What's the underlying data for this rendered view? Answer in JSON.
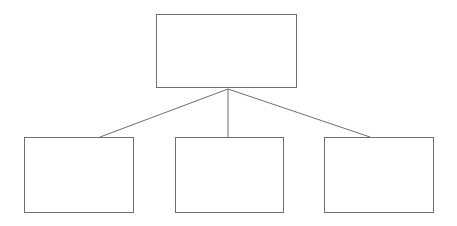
{
  "diagram": {
    "type": "hierarchy-tree",
    "orientation": "top-down",
    "canvas": {
      "width": 457,
      "height": 226,
      "background": "#ffffff"
    },
    "stroke_color": "#6f6f6f",
    "stroke_width": 1,
    "fill_color": "#ffffff",
    "nodes": [
      {
        "id": "root",
        "label": "",
        "level": 0,
        "x": 156,
        "y": 14,
        "width": 141,
        "height": 74
      },
      {
        "id": "child-1",
        "label": "",
        "level": 1,
        "x": 24,
        "y": 137,
        "width": 110,
        "height": 76
      },
      {
        "id": "child-2",
        "label": "",
        "level": 1,
        "x": 175,
        "y": 137,
        "width": 109,
        "height": 76
      },
      {
        "id": "child-3",
        "label": "",
        "level": 1,
        "x": 324,
        "y": 137,
        "width": 110,
        "height": 76
      }
    ],
    "junction": {
      "x": 228,
      "y": 89
    },
    "edges": [
      {
        "id": "edge-root-child-1",
        "from": "root",
        "to": "child-1",
        "x1": 228,
        "y1": 89,
        "x2": 100,
        "y2": 137
      },
      {
        "id": "edge-root-child-2",
        "from": "root",
        "to": "child-2",
        "x1": 228,
        "y1": 89,
        "x2": 228,
        "y2": 137
      },
      {
        "id": "edge-root-child-3",
        "from": "root",
        "to": "child-3",
        "x1": 228,
        "y1": 89,
        "x2": 370,
        "y2": 137
      }
    ]
  }
}
